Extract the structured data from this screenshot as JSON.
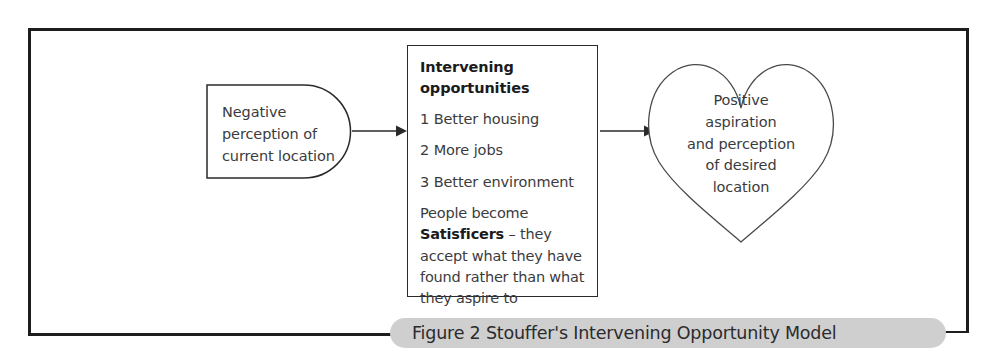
{
  "figure": {
    "caption": "Figure 2 Stouffer's Intervening Opportunity Model",
    "frame_color": "#1d1d1f",
    "banner_color": "#cfcfcf",
    "shape_outline_color": "#2a2a2c",
    "text_color": "#3b3b3d"
  },
  "origin": {
    "shape": "d-shape",
    "label": "Negative perception of current location"
  },
  "opportunities": {
    "title_line1": "Intervening",
    "title_line2": "opportunities",
    "items": [
      "1 Better housing",
      "2 More jobs",
      "3 Better environment"
    ],
    "note_prefix": "People become ",
    "note_bold": "Satisficers",
    "note_suffix": " – they accept what they have found rather than what they aspire to"
  },
  "destination": {
    "shape": "heart",
    "line1": "Positive",
    "line2": "aspiration",
    "line3": "and perception",
    "line4": "of desired",
    "line5": "location"
  },
  "arrows": [
    {
      "name": "arrow-origin-to-opportunities"
    },
    {
      "name": "arrow-opportunities-to-destination"
    }
  ]
}
